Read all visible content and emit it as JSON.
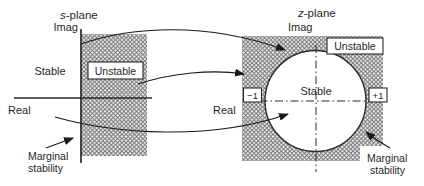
{
  "figure": {
    "colors": {
      "background": "#ffffff",
      "hatch": "#6f6f6f",
      "line": "#1a1a1a",
      "text": "#1f1f1f",
      "box_fill": "#ffffff"
    },
    "s_plane": {
      "title_prefix": "s",
      "title_suffix": "-plane",
      "imag_label": "Imag",
      "real_label": "Real",
      "stable_label": "Stable",
      "unstable_label": "Unstable",
      "marginal_label_line1": "Marginal",
      "marginal_label_line2": "stability"
    },
    "z_plane": {
      "title_prefix": "z",
      "title_suffix": "-plane",
      "imag_label": "Imag",
      "real_label": "Real",
      "stable_label": "Stable",
      "unstable_label": "Unstable",
      "minus_one_label": "−1",
      "plus_one_label": "+1",
      "marginal_label_line1": "Marginal",
      "marginal_label_line2": "stability"
    }
  }
}
